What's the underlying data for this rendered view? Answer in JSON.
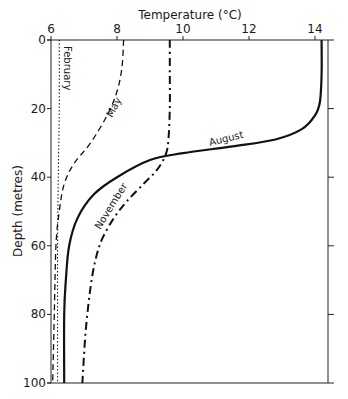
{
  "chart_data": {
    "type": "line",
    "title": "",
    "xlabel": "Temperature (°C)",
    "ylabel": "Depth (metres)",
    "xlim": [
      6,
      14.5
    ],
    "ylim": [
      100,
      0
    ],
    "x_ticks": [
      6,
      8,
      10,
      12,
      14
    ],
    "y_ticks": [
      0,
      20,
      40,
      60,
      80,
      100
    ],
    "x_axis_position": "top",
    "grid": false,
    "legend": "inline labels on curves",
    "series": [
      {
        "name": "February",
        "style": "dotted",
        "points": [
          [
            6.25,
            0
          ],
          [
            6.25,
            20
          ],
          [
            6.22,
            40
          ],
          [
            6.2,
            60
          ],
          [
            6.2,
            80
          ],
          [
            6.2,
            100
          ]
        ]
      },
      {
        "name": "May",
        "style": "dashed",
        "points": [
          [
            8.2,
            0
          ],
          [
            8.15,
            8
          ],
          [
            8.0,
            15
          ],
          [
            7.7,
            22
          ],
          [
            7.2,
            30
          ],
          [
            6.7,
            36
          ],
          [
            6.4,
            42
          ],
          [
            6.25,
            50
          ],
          [
            6.15,
            60
          ],
          [
            6.1,
            80
          ],
          [
            6.05,
            100
          ]
        ]
      },
      {
        "name": "August",
        "style": "solid",
        "points": [
          [
            14.2,
            0
          ],
          [
            14.2,
            10
          ],
          [
            14.15,
            18
          ],
          [
            14.0,
            22
          ],
          [
            13.6,
            26
          ],
          [
            12.8,
            29
          ],
          [
            11.5,
            31
          ],
          [
            10.0,
            33
          ],
          [
            9.0,
            35
          ],
          [
            8.0,
            40
          ],
          [
            7.3,
            45
          ],
          [
            6.8,
            52
          ],
          [
            6.55,
            60
          ],
          [
            6.45,
            70
          ],
          [
            6.4,
            80
          ],
          [
            6.4,
            100
          ]
        ]
      },
      {
        "name": "November",
        "style": "dash-dot",
        "points": [
          [
            9.6,
            0
          ],
          [
            9.6,
            10
          ],
          [
            9.6,
            20
          ],
          [
            9.55,
            30
          ],
          [
            9.45,
            34
          ],
          [
            9.2,
            38
          ],
          [
            8.8,
            42
          ],
          [
            8.3,
            47
          ],
          [
            7.9,
            52
          ],
          [
            7.55,
            58
          ],
          [
            7.35,
            64
          ],
          [
            7.2,
            72
          ],
          [
            7.05,
            85
          ],
          [
            6.95,
            100
          ]
        ]
      }
    ]
  }
}
